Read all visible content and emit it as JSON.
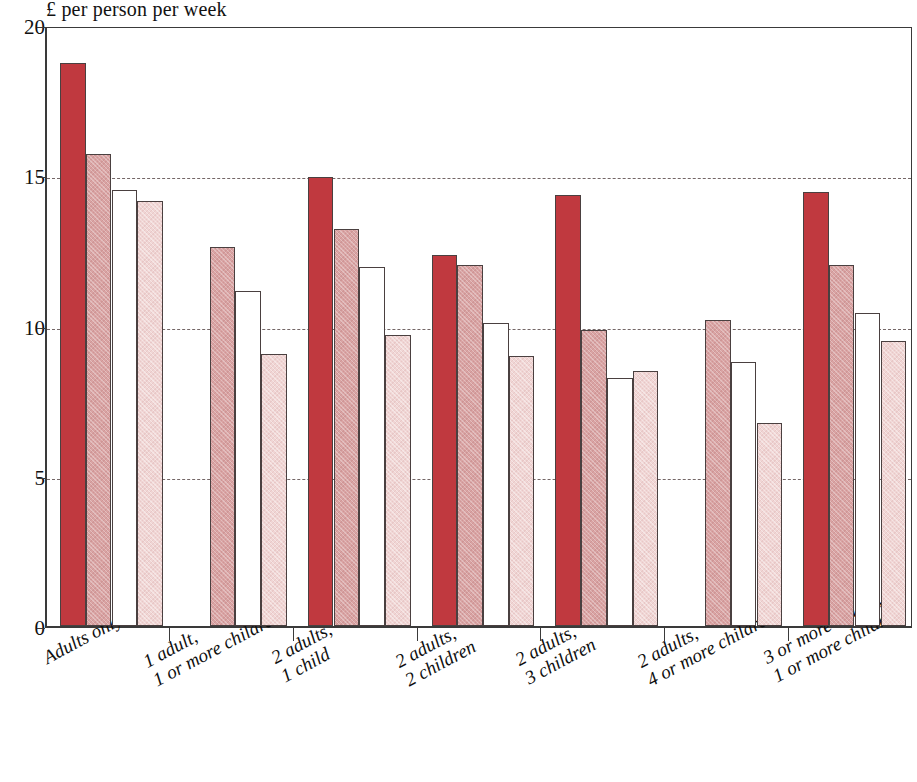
{
  "chart_data": {
    "type": "bar",
    "title": "£ per person per week",
    "xlabel": "",
    "ylabel": "£ per person per week",
    "ylim": [
      0,
      20
    ],
    "yticks": [
      0,
      5,
      10,
      15,
      20
    ],
    "grid": "horizontal-dashed",
    "legend": "none",
    "categories": [
      "Adults only",
      "1 adult, 1 or more children",
      "2 adults, 1 child",
      "2 adults, 2 children",
      "2 adults, 3 children",
      "2 adults, 4 or more children",
      "3 or more adults, 1 or more children"
    ],
    "category_lines": [
      [
        "Adults only",
        ""
      ],
      [
        "1 adult,",
        "1 or more children"
      ],
      [
        "2 adults,",
        "1 child"
      ],
      [
        "2 adults,",
        "2 children"
      ],
      [
        "2 adults,",
        "3 children"
      ],
      [
        "2 adults,",
        "4 or more children"
      ],
      [
        "3 or more adults,",
        "1 or more children"
      ]
    ],
    "series": [
      {
        "name": "series-1-dark-red",
        "color": "#c0393f",
        "values": [
          18.75,
          null,
          14.95,
          12.35,
          14.35,
          null,
          14.45
        ]
      },
      {
        "name": "series-2-medium-pink",
        "color": "#d9a3a3",
        "values": [
          15.7,
          12.6,
          13.2,
          12.0,
          9.85,
          10.2,
          12.0
        ]
      },
      {
        "name": "series-3-white",
        "color": "#ffffff",
        "values": [
          14.5,
          11.15,
          11.95,
          10.1,
          8.25,
          8.8,
          10.4
        ]
      },
      {
        "name": "series-4-light-pink",
        "color": "#f0d5d4",
        "values": [
          14.15,
          9.05,
          9.7,
          9.0,
          8.5,
          6.75,
          9.5
        ]
      }
    ]
  },
  "axis": {
    "ytick_labels": [
      "0",
      "5",
      "10",
      "15",
      "20"
    ]
  },
  "colors": {
    "dark_red": "#c0393f",
    "medium_pink": "#d9a3a3",
    "white": "#ffffff",
    "light_pink": "#f0d5d4",
    "axis": "#3a3a3a",
    "gridline": "#6d5f5f"
  }
}
